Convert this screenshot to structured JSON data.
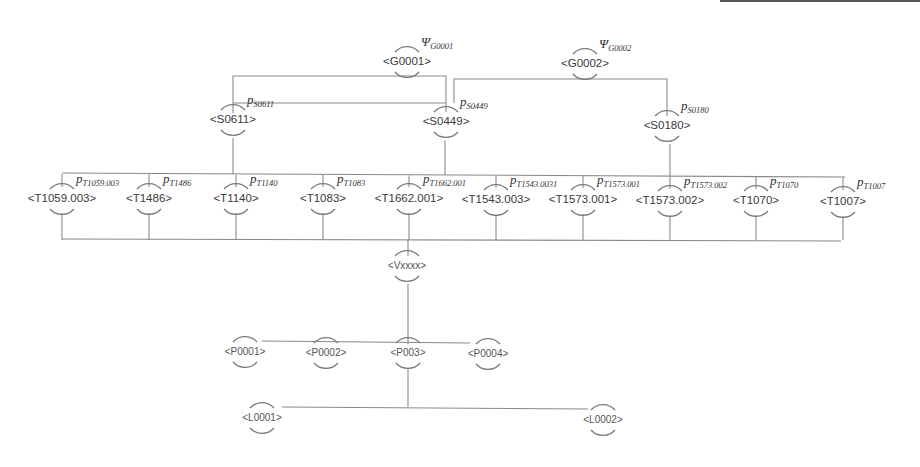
{
  "diagram": {
    "type": "hierarchy-tree",
    "colors": {
      "line": "#8a8a8a",
      "arc": "#7a7a7a",
      "text": "#3a3a3a"
    },
    "levels": {
      "goals": [
        {
          "id": "G0001",
          "label": "<G0001>",
          "symbol": "Ψ",
          "subscript": "G0001",
          "x": 407,
          "y": 62
        },
        {
          "id": "G0002",
          "label": "<G0002>",
          "symbol": "Ψ",
          "subscript": "G0002",
          "x": 585,
          "y": 64
        }
      ],
      "strategies": [
        {
          "id": "S0611",
          "label": "<S0611>",
          "symbol": "p",
          "subscript": "S0611",
          "x": 233,
          "y": 120
        },
        {
          "id": "S0449",
          "label": "<S0449>",
          "symbol": "p",
          "subscript": "S0449",
          "x": 446,
          "y": 122
        },
        {
          "id": "S0180",
          "label": "<S0180>",
          "symbol": "p",
          "subscript": "S0180",
          "x": 667,
          "y": 126
        }
      ],
      "techniques": [
        {
          "id": "T1059.003",
          "label": "<T1059.003>",
          "symbol": "p",
          "subscript": "T1059.003",
          "x": 62,
          "y": 199
        },
        {
          "id": "T1486",
          "label": "<T1486>",
          "symbol": "p",
          "subscript": "T1486",
          "x": 149,
          "y": 199
        },
        {
          "id": "T1140",
          "label": "<T1140>",
          "symbol": "p",
          "subscript": "T1140",
          "x": 236,
          "y": 199
        },
        {
          "id": "T1083",
          "label": "<T1083>",
          "symbol": "p",
          "subscript": "T1083",
          "x": 323,
          "y": 199
        },
        {
          "id": "T1662.001",
          "label": "<T1662.001>",
          "symbol": "p",
          "subscript": "T1662.001",
          "x": 409,
          "y": 199
        },
        {
          "id": "T1543.003",
          "label": "<T1543.003>",
          "symbol": "p",
          "subscript": "T1543.0031",
          "x": 496,
          "y": 200
        },
        {
          "id": "T1573.001",
          "label": "<T1573.001>",
          "symbol": "p",
          "subscript": "T1573.001",
          "x": 583,
          "y": 200
        },
        {
          "id": "T1573.002",
          "label": "<T1573.002>",
          "symbol": "p",
          "subscript": "T1573.002",
          "x": 670,
          "y": 201
        },
        {
          "id": "T1070",
          "label": "<T1070>",
          "symbol": "p",
          "subscript": "T1070",
          "x": 756,
          "y": 201
        },
        {
          "id": "T1007",
          "label": "<T1007>",
          "symbol": "p",
          "subscript": "T1007",
          "x": 843,
          "y": 202
        }
      ],
      "vulnerability": {
        "id": "Vxxxx",
        "label": "<Vxxxx>",
        "x": 407,
        "y": 266
      },
      "products": [
        {
          "id": "P0001",
          "label": "<P0001>",
          "x": 245,
          "y": 352
        },
        {
          "id": "P0002",
          "label": "<P0002>",
          "x": 326,
          "y": 353
        },
        {
          "id": "P003",
          "label": "<P003>",
          "x": 408,
          "y": 353
        },
        {
          "id": "P0004",
          "label": "<P0004>",
          "x": 488,
          "y": 354
        }
      ],
      "locations": [
        {
          "id": "L0001",
          "label": "<L0001>",
          "x": 262,
          "y": 418
        },
        {
          "id": "L0002",
          "label": "<L0002>",
          "x": 603,
          "y": 420
        }
      ]
    }
  }
}
